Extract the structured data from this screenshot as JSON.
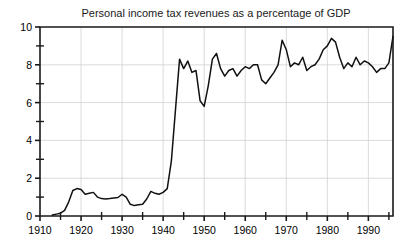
{
  "chart_data": {
    "type": "line",
    "title": "Personal income tax revenues as a percentage of GDP",
    "xlabel": "",
    "ylabel": "",
    "xlim": [
      1910,
      1996
    ],
    "ylim": [
      0,
      10
    ],
    "grid": true,
    "legend": "none",
    "x_ticks_major": [
      1910,
      1920,
      1930,
      1940,
      1950,
      1960,
      1970,
      1980,
      1990
    ],
    "x_tick_labels": [
      "1910",
      "1920",
      "1930",
      "1940",
      "1950",
      "1960",
      "1970",
      "1980",
      "1990"
    ],
    "x_ticks_minor": [
      1915,
      1925,
      1935,
      1945,
      1955,
      1965,
      1975,
      1985,
      1995
    ],
    "y_ticks_major": [
      0,
      2,
      4,
      6,
      8,
      10
    ],
    "y_tick_labels": [
      "0",
      "2",
      "4",
      "6",
      "8",
      "10"
    ],
    "y_ticks_minor": [
      1,
      3,
      5,
      7,
      9
    ],
    "series": [
      {
        "name": "Personal income tax revenues (% of GDP)",
        "color": "#111111",
        "x": [
          1913,
          1914,
          1915,
          1916,
          1917,
          1918,
          1919,
          1920,
          1921,
          1922,
          1923,
          1924,
          1925,
          1926,
          1927,
          1928,
          1929,
          1930,
          1931,
          1932,
          1933,
          1934,
          1935,
          1936,
          1937,
          1938,
          1939,
          1940,
          1941,
          1942,
          1943,
          1944,
          1945,
          1946,
          1947,
          1948,
          1949,
          1950,
          1951,
          1952,
          1953,
          1954,
          1955,
          1956,
          1957,
          1958,
          1959,
          1960,
          1961,
          1962,
          1963,
          1964,
          1965,
          1966,
          1967,
          1968,
          1969,
          1970,
          1971,
          1972,
          1973,
          1974,
          1975,
          1976,
          1977,
          1978,
          1979,
          1980,
          1981,
          1982,
          1983,
          1984,
          1985,
          1986,
          1987,
          1988,
          1989,
          1990,
          1991,
          1992,
          1993,
          1994,
          1995,
          1996
        ],
        "values": [
          0.05,
          0.1,
          0.15,
          0.3,
          0.75,
          1.35,
          1.45,
          1.4,
          1.15,
          1.2,
          1.25,
          1.0,
          0.92,
          0.9,
          0.92,
          0.95,
          0.98,
          1.15,
          1.0,
          0.62,
          0.55,
          0.6,
          0.62,
          0.9,
          1.3,
          1.2,
          1.15,
          1.25,
          1.45,
          2.9,
          5.6,
          8.3,
          7.8,
          8.2,
          7.6,
          7.7,
          6.1,
          5.8,
          6.9,
          8.3,
          8.6,
          7.8,
          7.4,
          7.7,
          7.8,
          7.4,
          7.7,
          7.9,
          7.8,
          8.0,
          8.0,
          7.2,
          7.0,
          7.3,
          7.6,
          8.0,
          9.3,
          8.8,
          7.9,
          8.1,
          8.0,
          8.4,
          7.7,
          7.9,
          8.0,
          8.3,
          8.8,
          9.0,
          9.4,
          9.2,
          8.4,
          7.8,
          8.1,
          7.9,
          8.4,
          8.0,
          8.2,
          8.1,
          7.9,
          7.6,
          7.8,
          7.8,
          8.1,
          9.5
        ]
      }
    ]
  },
  "axes": {
    "plot_left": 40,
    "plot_right": 393,
    "plot_top": 27,
    "plot_bottom": 216
  }
}
